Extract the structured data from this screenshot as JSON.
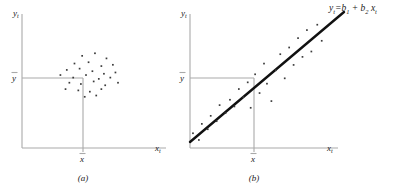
{
  "figure": {
    "type": "two-panel-scatter-diagram",
    "background_color": "#ffffff",
    "axis_color": "#a9a9a9",
    "dot_color": "#3b3b3b",
    "line_color": "#111111"
  },
  "panel_a": {
    "caption": "(a)",
    "y_axis_label": "y",
    "y_axis_label_sub": "t",
    "x_axis_label": "x",
    "x_axis_label_sub": "t",
    "y_mean_tick": "y",
    "x_mean_tick": "x",
    "description": "scatter of points clustered around the means with no trend"
  },
  "panel_b": {
    "caption": "(b)",
    "y_axis_label": "y",
    "y_axis_label_sub": "t",
    "x_axis_label": "x",
    "x_axis_label_sub": "t",
    "y_mean_tick": "y",
    "x_mean_tick": "x",
    "equation": {
      "lhs_var": "y",
      "lhs_sub": "t",
      "hat": "^",
      "equals": "=",
      "b1": "b",
      "b1_sub": "1",
      "plus": "+",
      "b2": "b",
      "b2_sub": "2",
      "x_var": "x",
      "x_sub": "t",
      "full_text": "ŷt = b1 + b2 xt"
    },
    "description": "scatter of points along an upward sloping fitted regression line"
  },
  "chart_data": [
    {
      "type": "scatter",
      "title": "(a)",
      "xlabel": "x_t",
      "ylabel": "y_t",
      "xlim": [
        0,
        100
      ],
      "ylim": [
        0,
        100
      ],
      "grid": false,
      "legend": "none",
      "annotations": [
        "x-bar reference line",
        "y-bar reference line"
      ],
      "x_mean": 50,
      "y_mean": 57,
      "points": [
        [
          47,
          72
        ],
        [
          57,
          74
        ],
        [
          66,
          70
        ],
        [
          41,
          66
        ],
        [
          52,
          67
        ],
        [
          62,
          64
        ],
        [
          71,
          65
        ],
        [
          35,
          61
        ],
        [
          45,
          62
        ],
        [
          55,
          60
        ],
        [
          64,
          58
        ],
        [
          73,
          59
        ],
        [
          30,
          57
        ],
        [
          40,
          55
        ],
        [
          50,
          57
        ],
        [
          60,
          54
        ],
        [
          69,
          55
        ],
        [
          37,
          51
        ],
        [
          46,
          50
        ],
        [
          56,
          52
        ],
        [
          65,
          49
        ],
        [
          75,
          51
        ],
        [
          34,
          46
        ],
        [
          44,
          45
        ],
        [
          53,
          44
        ],
        [
          62,
          46
        ],
        [
          49,
          40
        ],
        [
          58,
          41
        ]
      ]
    },
    {
      "type": "scatter",
      "title": "(b)",
      "xlabel": "x_t",
      "ylabel": "y_t",
      "xlim": [
        0,
        100
      ],
      "ylim": [
        0,
        100
      ],
      "grid": false,
      "legend": "none",
      "annotations": [
        "fitted line y-hat_t = b_1 + b_2 x_t",
        "x-bar reference line",
        "y-bar reference line"
      ],
      "x_mean": 50,
      "y_mean": 57,
      "fit_line": {
        "x_start": -5,
        "y_start": 4,
        "x_end": 97,
        "y_end": 106
      },
      "points": [
        [
          2,
          11
        ],
        [
          6,
          6
        ],
        [
          8,
          18
        ],
        [
          12,
          14
        ],
        [
          14,
          24
        ],
        [
          18,
          20
        ],
        [
          20,
          32
        ],
        [
          24,
          26
        ],
        [
          27,
          36
        ],
        [
          30,
          31
        ],
        [
          33,
          44
        ],
        [
          36,
          38
        ],
        [
          39,
          49
        ],
        [
          41,
          30
        ],
        [
          44,
          55
        ],
        [
          47,
          41
        ],
        [
          50,
          63
        ],
        [
          52,
          48
        ],
        [
          55,
          35
        ],
        [
          58,
          58
        ],
        [
          61,
          70
        ],
        [
          64,
          52
        ],
        [
          67,
          75
        ],
        [
          70,
          62
        ],
        [
          73,
          82
        ],
        [
          76,
          68
        ],
        [
          79,
          88
        ],
        [
          82,
          72
        ],
        [
          86,
          92
        ],
        [
          89,
          80
        ]
      ]
    }
  ]
}
